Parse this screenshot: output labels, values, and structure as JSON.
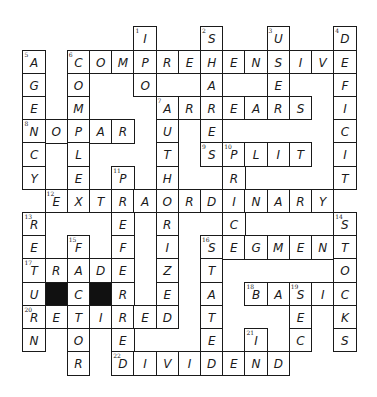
{
  "puzzle": {
    "type": "crossword",
    "rows": 15,
    "cols": 15,
    "grid": [
      ".....I..S..U..D",
      "A.COMPREHENSIVE",
      "G.O..O..A..E..F",
      "E.M...ARREARS.I",
      "NOPAR.U.E.....C",
      "C.L...T.SPLIT.I",
      "Y.E.P.H..R....T",
      ".EXTRAORDINARY.",
      "R...E.R..C....S",
      "E.F.F.I.SEGMENT",
      "TRADE.Z.T.....O",
      "U#C#R.E.A.BASIC",
      "RETIRED.T...E.K",
      "N.O.E...E.I.C.S",
      "..R.DIVIDEND..."
    ],
    "numbers": [
      {
        "n": "1",
        "r": 0,
        "c": 5
      },
      {
        "n": "2",
        "r": 0,
        "c": 8
      },
      {
        "n": "3",
        "r": 0,
        "c": 11
      },
      {
        "n": "4",
        "r": 0,
        "c": 14
      },
      {
        "n": "5",
        "r": 1,
        "c": 0
      },
      {
        "n": "6",
        "r": 1,
        "c": 2
      },
      {
        "n": "7",
        "r": 3,
        "c": 6
      },
      {
        "n": "8",
        "r": 4,
        "c": 0
      },
      {
        "n": "9",
        "r": 5,
        "c": 8
      },
      {
        "n": "10",
        "r": 5,
        "c": 9
      },
      {
        "n": "11",
        "r": 6,
        "c": 4
      },
      {
        "n": "12",
        "r": 7,
        "c": 1
      },
      {
        "n": "13",
        "r": 8,
        "c": 0
      },
      {
        "n": "14",
        "r": 8,
        "c": 14
      },
      {
        "n": "15",
        "r": 9,
        "c": 2
      },
      {
        "n": "16",
        "r": 9,
        "c": 8
      },
      {
        "n": "17",
        "r": 10,
        "c": 0
      },
      {
        "n": "18",
        "r": 11,
        "c": 10
      },
      {
        "n": "19",
        "r": 11,
        "c": 12
      },
      {
        "n": "20",
        "r": 12,
        "c": 0
      },
      {
        "n": "21",
        "r": 13,
        "c": 10
      },
      {
        "n": "22",
        "r": 14,
        "c": 4
      }
    ],
    "answers": {
      "across": [
        {
          "n": "6",
          "answer": "COMPREHENSIVE"
        },
        {
          "n": "7",
          "answer": "ARREARS"
        },
        {
          "n": "8",
          "answer": "NOPAR"
        },
        {
          "n": "9",
          "answer": "SPLIT"
        },
        {
          "n": "12",
          "answer": "EXTRAORDINARY"
        },
        {
          "n": "16",
          "answer": "SEGMENT"
        },
        {
          "n": "17",
          "answer": "TRADE"
        },
        {
          "n": "18",
          "answer": "BASIC"
        },
        {
          "n": "20",
          "answer": "RETIRED"
        },
        {
          "n": "22",
          "answer": "DIVIDEND"
        }
      ],
      "down": [
        {
          "n": "1",
          "answer": "IPO"
        },
        {
          "n": "2",
          "answer": "SHARES"
        },
        {
          "n": "3",
          "answer": "USE"
        },
        {
          "n": "4",
          "answer": "DEFICIT"
        },
        {
          "n": "5",
          "answer": "AGENCY"
        },
        {
          "n": "6",
          "answer": "COMPLEX"
        },
        {
          "n": "7",
          "answer": "AUTHORIZED"
        },
        {
          "n": "10",
          "answer": "PRICE"
        },
        {
          "n": "11",
          "answer": "PREFERRED"
        },
        {
          "n": "13",
          "answer": "RETURN"
        },
        {
          "n": "14",
          "answer": "STOCKS"
        },
        {
          "n": "15",
          "answer": "FACTOR"
        },
        {
          "n": "16",
          "answer": "STATE"
        },
        {
          "n": "19",
          "answer": "SEC"
        },
        {
          "n": "21",
          "answer": "IN"
        }
      ]
    }
  },
  "layout": {
    "origin_x": 23,
    "origin_y": 27,
    "cell_w": 22.2,
    "cell_h": 23.2
  },
  "colors": {
    "ink": "#1a1a1a",
    "black_square": "#111111",
    "background": "#ffffff"
  }
}
